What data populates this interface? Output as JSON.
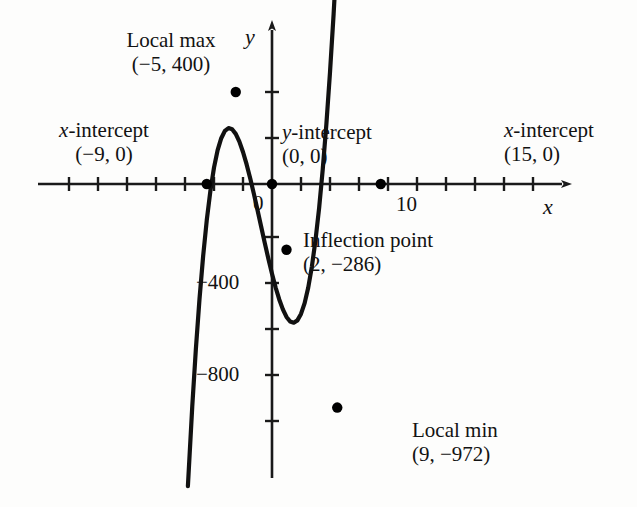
{
  "chart_data": {
    "type": "line",
    "title": "",
    "xlabel": "x",
    "ylabel": "y",
    "grid": false,
    "legend": null,
    "xlim": [
      -13,
      19
    ],
    "ylim": [
      -1100,
      600
    ],
    "x_ticks": [
      -12,
      -10,
      -8,
      -6,
      -4,
      -2,
      0,
      2,
      4,
      6,
      8,
      10,
      12,
      14,
      16,
      18
    ],
    "x_tick_labels": [
      {
        "value": 10,
        "text": "10"
      },
      {
        "value": 0,
        "text": "0"
      }
    ],
    "y_ticks": [
      400,
      200,
      0,
      -200,
      -400,
      -600,
      -800,
      -1000
    ],
    "y_tick_labels": [
      {
        "value": -400,
        "text": "−400"
      },
      {
        "value": -800,
        "text": "−800"
      }
    ],
    "curve_label": "y = (4/9)x(x+9)(x−15)",
    "series": [
      {
        "name": "cubic",
        "x": [
          -11.6,
          -11,
          -10.5,
          -10,
          -9.5,
          -9,
          -8.5,
          -8,
          -7.5,
          -7,
          -6.5,
          -6,
          -5.5,
          -5,
          -4.5,
          -4,
          -3.5,
          -3,
          -2.5,
          -2,
          -1.5,
          -1,
          -0.5,
          0,
          0.5,
          1,
          1.5,
          2,
          2.5,
          3,
          3.5,
          4,
          4.5,
          5,
          5.5,
          6,
          6.5,
          7,
          7.5,
          8,
          8.5,
          9,
          9.5,
          10,
          10.5,
          11,
          11.5,
          12,
          12.5,
          13,
          13.5,
          14,
          14.5,
          15,
          15.5,
          16,
          16.4
        ],
        "y": [
          -1314,
          -968,
          -717,
          -500,
          -314,
          -158,
          -30,
          71,
          147,
          199,
          231,
          243,
          238,
          218,
          184,
          139,
          85,
          24,
          -43,
          -113,
          -185,
          -256,
          -325,
          -390,
          -450,
          -502,
          -545,
          -578,
          -598,
          -603,
          -593,
          -565,
          -518,
          -450,
          -359,
          -244,
          -104,
          64,
          260,
          485,
          740,
          1026,
          1344,
          1694,
          2078,
          2497,
          2951,
          3441,
          3969,
          4534,
          5138,
          5781,
          6464,
          7188,
          7953,
          8760,
          9404
        ]
      }
    ],
    "points": [
      {
        "name": "x-intercept-left",
        "x": -9,
        "y": 0
      },
      {
        "name": "local-max",
        "x": -5,
        "y": 400
      },
      {
        "name": "y-intercept",
        "x": 0,
        "y": 0
      },
      {
        "name": "inflection-point",
        "x": 2,
        "y": -286
      },
      {
        "name": "local-min",
        "x": 9,
        "y": -972
      },
      {
        "name": "x-intercept-right",
        "x": 15,
        "y": 0
      }
    ]
  },
  "annotations": {
    "local_max": {
      "line1": "Local max",
      "line2": "(−5, 400)"
    },
    "x_intercept_left": {
      "line1_prefix": "x",
      "line1_rest": "-intercept",
      "line2": "(−9, 0)"
    },
    "y_intercept": {
      "line1_prefix": "y",
      "line1_rest": "-intercept",
      "line2": "(0, 0)"
    },
    "x_intercept_right": {
      "line1_prefix": "x",
      "line1_rest": "-intercept",
      "line2": "(15, 0)"
    },
    "inflection": {
      "line1": "Inflection point",
      "line2": "(2, −286)"
    },
    "local_min": {
      "line1": "Local min",
      "line2": "(9, −972)"
    }
  },
  "axis_labels": {
    "x": "x",
    "y": "y",
    "origin": "0",
    "y_neg400": "−400",
    "y_neg800": "−800",
    "x_ten": "10"
  },
  "colors": {
    "curve": "#111111",
    "axis": "#1a1a1a",
    "text": "#121212",
    "background": "#fdfdfc",
    "point": "#000000"
  }
}
